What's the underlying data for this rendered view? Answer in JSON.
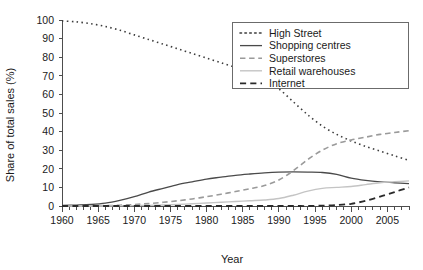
{
  "chart_data": {
    "type": "line",
    "title": "",
    "xlabel": "Year",
    "ylabel": "Share of total sales (%)",
    "xlim": [
      1960,
      2008
    ],
    "ylim": [
      0,
      100
    ],
    "grid": false,
    "legend_position": "top-right",
    "xticks": [
      1960,
      1965,
      1970,
      1975,
      1980,
      1985,
      1990,
      1995,
      2000,
      2005
    ],
    "xtick_labels": [
      "1960",
      "1965",
      "1970",
      "1975",
      "1980",
      "1985",
      "1990",
      "1995",
      "2000",
      "2005"
    ],
    "yticks": [
      0,
      10,
      20,
      30,
      40,
      50,
      60,
      70,
      80,
      90,
      100
    ],
    "ytick_labels": [
      "0",
      "10",
      "20",
      "30",
      "40",
      "50",
      "60",
      "70",
      "80",
      "90",
      "100"
    ],
    "minor_xtick_interval": 1,
    "x": [
      1960,
      1962,
      1964,
      1966,
      1968,
      1970,
      1972,
      1974,
      1976,
      1978,
      1980,
      1982,
      1984,
      1986,
      1988,
      1990,
      1992,
      1994,
      1996,
      1998,
      2000,
      2002,
      2004,
      2006,
      2008
    ],
    "series": [
      {
        "name": "High Street",
        "style": "dotted",
        "color": "#3c3c3c",
        "width": 1.6,
        "values": [
          99.5,
          99.0,
          98.0,
          96.5,
          94.5,
          92.0,
          89.5,
          87.0,
          84.5,
          82.0,
          79.5,
          77.0,
          74.5,
          71.5,
          68.0,
          63.0,
          56.0,
          49.0,
          43.0,
          38.5,
          35.0,
          32.0,
          29.5,
          27.0,
          24.5
        ]
      },
      {
        "name": "Shopping centres",
        "style": "solid",
        "color": "#4a4a4a",
        "width": 1.3,
        "values": [
          0.3,
          0.5,
          0.8,
          1.5,
          3.0,
          5.0,
          7.5,
          9.5,
          11.5,
          13.0,
          14.5,
          15.5,
          16.5,
          17.2,
          17.8,
          18.2,
          18.3,
          18.2,
          18.0,
          17.0,
          15.0,
          13.8,
          13.0,
          12.5,
          12.0
        ]
      },
      {
        "name": "Superstores",
        "style": "dashed",
        "color": "#9a9a9a",
        "width": 1.6,
        "values": [
          0.0,
          0.0,
          0.1,
          0.2,
          0.4,
          0.8,
          1.3,
          2.0,
          2.8,
          3.8,
          5.0,
          6.3,
          7.8,
          9.3,
          11.0,
          14.0,
          19.0,
          25.0,
          30.0,
          33.5,
          35.5,
          37.0,
          38.5,
          39.5,
          40.5
        ]
      },
      {
        "name": "Retail warehouses",
        "style": "solid",
        "color": "#c4c4c4",
        "width": 1.4,
        "values": [
          0.0,
          0.0,
          0.0,
          0.0,
          0.1,
          0.2,
          0.3,
          0.5,
          0.8,
          1.2,
          1.6,
          2.0,
          2.4,
          2.8,
          3.2,
          4.0,
          5.8,
          8.0,
          9.5,
          10.0,
          10.5,
          11.5,
          12.5,
          13.0,
          13.5
        ]
      },
      {
        "name": "Internet",
        "style": "dashed",
        "color": "#2a2a2a",
        "width": 1.8,
        "values": [
          0.0,
          0.0,
          0.0,
          0.0,
          0.0,
          0.0,
          0.0,
          0.0,
          0.0,
          0.0,
          0.0,
          0.0,
          0.0,
          0.0,
          0.0,
          0.0,
          0.0,
          0.0,
          0.2,
          0.5,
          1.2,
          2.8,
          5.0,
          7.5,
          10.0
        ]
      }
    ],
    "legend_entries": [
      {
        "label": "High Street",
        "style": "dotted",
        "color": "#3c3c3c"
      },
      {
        "label": "Shopping centres",
        "style": "solid",
        "color": "#4a4a4a"
      },
      {
        "label": "Superstores",
        "style": "dashed",
        "color": "#9a9a9a"
      },
      {
        "label": "Retail warehouses",
        "style": "solid",
        "color": "#c4c4c4"
      },
      {
        "label": "Internet",
        "style": "dashed",
        "color": "#2a2a2a"
      }
    ]
  }
}
